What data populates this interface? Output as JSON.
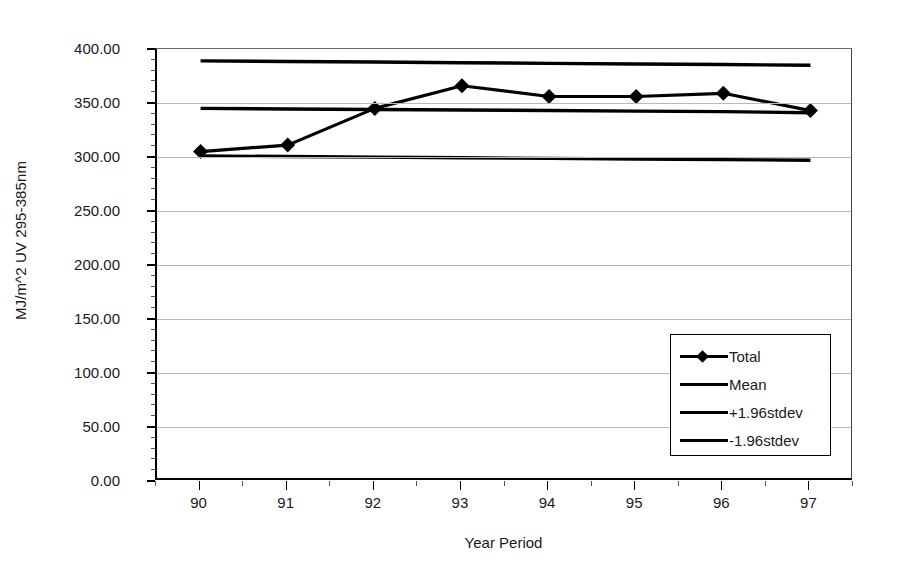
{
  "chart_data": {
    "type": "line",
    "title": "",
    "xlabel": "Year Period",
    "ylabel": "MJ/m^2 UV 295-385nm",
    "categories": [
      "90",
      "91",
      "92",
      "93",
      "94",
      "95",
      "96",
      "97"
    ],
    "ylim": [
      0.0,
      400.0
    ],
    "ytick_step": 50.0,
    "ytick_labels": [
      "400.00",
      "350.00",
      "300.00",
      "250.00",
      "200.00",
      "150.00",
      "100.00",
      "50.00",
      "0.00"
    ],
    "ytick_values": [
      400.0,
      350.0,
      300.0,
      250.0,
      200.0,
      150.0,
      100.0,
      50.0,
      0.0
    ],
    "grid": true,
    "legend_position": "inside-lower-right",
    "series": [
      {
        "name": "Total",
        "marker": "diamond",
        "values": [
          305.0,
          311.0,
          345.0,
          366.0,
          356.0,
          356.0,
          359.0,
          343.0
        ]
      },
      {
        "name": "Mean",
        "marker": "none",
        "values": [
          345.0,
          344.5,
          344.0,
          343.5,
          343.0,
          342.5,
          342.0,
          341.0
        ]
      },
      {
        "name": "+1.96stdev",
        "marker": "none",
        "values": [
          389.0,
          388.4,
          387.9,
          387.3,
          386.7,
          386.1,
          385.6,
          385.0
        ]
      },
      {
        "name": "-1.96stdev",
        "marker": "none",
        "values": [
          301.0,
          300.4,
          299.9,
          299.3,
          298.7,
          298.1,
          297.6,
          297.0
        ]
      }
    ]
  },
  "axes": {
    "y_title": "MJ/m^2 UV 295-385nm",
    "x_title": "Year Period"
  },
  "legend": {
    "entries": [
      {
        "label": "Total",
        "swatch": "line-with-diamond-marker",
        "color": "#000000"
      },
      {
        "label": "Mean",
        "swatch": "line",
        "color": "#000000"
      },
      {
        "label": "+1.96stdev",
        "swatch": "line",
        "color": "#000000"
      },
      {
        "label": "-1.96stdev",
        "swatch": "line",
        "color": "#000000"
      }
    ]
  },
  "colors": {
    "series": "#000000",
    "gridline": "#b9b9b9",
    "axis": "#000000",
    "background": "#ffffff",
    "text": "#1a1a1a"
  }
}
